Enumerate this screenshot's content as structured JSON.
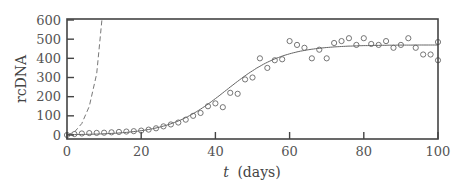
{
  "chart_data": {
    "type": "scatter",
    "title": "",
    "xlabel_var": "t",
    "xlabel_unit": "(days)",
    "xlabel": "t (days)",
    "ylabel": "rcDNA",
    "xlim": [
      0,
      100
    ],
    "ylim": [
      0,
      600
    ],
    "xticks": [
      0,
      20,
      40,
      60,
      80,
      100
    ],
    "yticks": [
      0,
      100,
      200,
      300,
      400,
      500,
      600
    ],
    "grid": false,
    "legend": null,
    "series": [
      {
        "name": "observed",
        "style": "open-circle",
        "x": [
          0,
          2,
          4,
          6,
          8,
          10,
          12,
          14,
          16,
          18,
          20,
          22,
          24,
          26,
          28,
          30,
          32,
          34,
          36,
          38,
          40,
          42,
          44,
          46,
          48,
          50,
          52,
          54,
          56,
          58,
          60,
          62,
          64,
          66,
          68,
          70,
          72,
          74,
          76,
          78,
          80,
          82,
          84,
          86,
          88,
          90,
          92,
          94,
          96,
          98,
          100
        ],
        "values": [
          0,
          5,
          8,
          10,
          11,
          12,
          14,
          16,
          18,
          20,
          23,
          28,
          35,
          45,
          55,
          65,
          80,
          100,
          115,
          150,
          165,
          145,
          220,
          215,
          290,
          300,
          400,
          350,
          390,
          395,
          490,
          470,
          455,
          400,
          445,
          400,
          480,
          490,
          505,
          470,
          505,
          475,
          470,
          490,
          455,
          470,
          505,
          455,
          420,
          420,
          485
        ]
      },
      {
        "name": "model fit",
        "style": "solid-line",
        "function": "logistic",
        "params": {
          "K": 470,
          "r": 0.13,
          "t_mid": 43,
          "y0": 0
        }
      },
      {
        "name": "exponential growth",
        "style": "dashed-line",
        "function": "exponential",
        "x": [
          0,
          2,
          4,
          6,
          8,
          9.4
        ],
        "values": [
          0,
          15,
          60,
          150,
          320,
          600
        ]
      }
    ],
    "extra_points": [
      {
        "x": 100,
        "y": 390
      }
    ]
  }
}
